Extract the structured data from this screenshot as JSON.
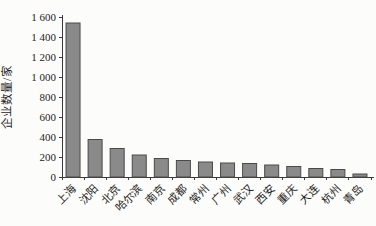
{
  "figure": {
    "background": "#fcfcfa",
    "bar_fill": "#8a8a8a",
    "bar_stroke": "#4a4a4a",
    "axis_color": "#3a3a3a",
    "text_color": "#1d1d1d"
  },
  "chart_data": {
    "type": "bar",
    "title": "",
    "xlabel": "",
    "ylabel": "企业数量/家",
    "categories": [
      "上海",
      "沈阳",
      "北京",
      "哈尔滨",
      "南京",
      "成都",
      "常州",
      "广州",
      "武汉",
      "西安",
      "重庆",
      "大连",
      "杭州",
      "青岛"
    ],
    "values": [
      1540,
      375,
      285,
      220,
      185,
      165,
      150,
      140,
      135,
      120,
      105,
      85,
      75,
      30
    ],
    "ylim": [
      0,
      1600
    ],
    "ytick_interval": 200,
    "ytick_labels": [
      "0",
      "200",
      "400",
      "600",
      "800",
      "1 000",
      "1 200",
      "1 400",
      "1 600"
    ],
    "grid": false,
    "legend": null,
    "x_label_rotation_deg": 45
  }
}
